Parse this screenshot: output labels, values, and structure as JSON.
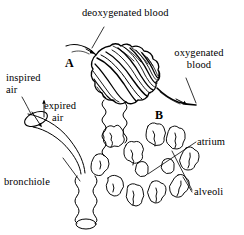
{
  "figure": {
    "type": "biology-diagram",
    "background_color": "#ffffff",
    "ink_color": "#000000"
  },
  "labels": {
    "deoxygenated_blood": "deoxygenated blood",
    "oxygenated_blood_line1": "oxygenated",
    "oxygenated_blood_line2": "blood",
    "inspired_air_line1": "inspired",
    "inspired_air_line2": "air",
    "expired_air_line1": "expired",
    "expired_air_line2": "air",
    "bronchiole": "bronchiole",
    "atrium": "atrium",
    "alveoli": "alveoli",
    "marker_a": "A",
    "marker_b": "B"
  },
  "structures": {
    "capillary_network": "capillary-network-over-alveolar-sac",
    "alveolar_cluster": "alveoli-cluster",
    "bronchiole_tube": "bronchiole-tube",
    "incoming_vessel": "pulmonary-arteriole-deoxygenated",
    "outgoing_vessel": "pulmonary-venule-oxygenated"
  },
  "arrows": {
    "blood_in": "arrow-into-capillary-network",
    "blood_out": "arrow-out-of-capillary-network",
    "inspired_air": "arrow-down-into-bronchiole",
    "expired_air": "arrow-up-out-of-bronchiole"
  }
}
